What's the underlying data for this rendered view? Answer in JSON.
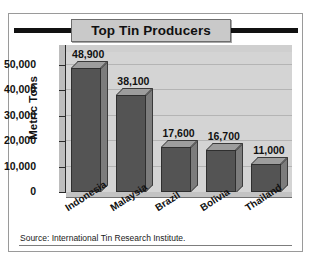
{
  "figure": {
    "title": "Top Tin Producers",
    "source": "Source: International Tin Research Institute."
  },
  "colors": {
    "bar_front": "#545454",
    "bar_top": "#9d9d9d",
    "bar_side": "#7c7c7c",
    "plot_background": "#d4d4d4",
    "title_banner": "#c9c9c9",
    "rule": "#111111"
  },
  "chart_data": {
    "type": "bar",
    "title": "Top Tin Producers",
    "xlabel": "",
    "ylabel": "Metric Tons",
    "categories": [
      "Indonesia",
      "Malaysia",
      "Brazil",
      "Bolivia",
      "Thailand"
    ],
    "values": [
      48900,
      38100,
      17600,
      16700,
      11000
    ],
    "value_labels": [
      "48,900",
      "38,100",
      "17,600",
      "16,700",
      "11,000"
    ],
    "ylim": [
      0,
      55000
    ],
    "yticks": [
      0,
      10000,
      20000,
      30000,
      40000,
      50000
    ],
    "ytick_labels": [
      "0",
      "10,000",
      "20,000",
      "30,000",
      "40,000",
      "50,000"
    ],
    "grid": true,
    "legend": false,
    "style": "3d-bar"
  }
}
